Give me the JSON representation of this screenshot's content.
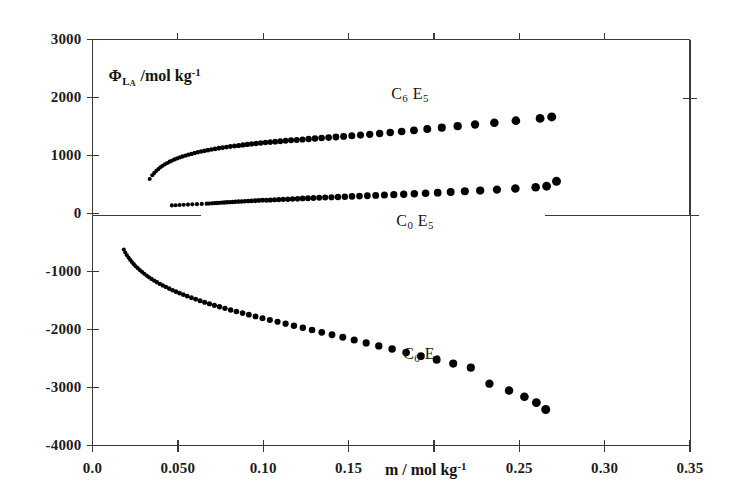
{
  "chart_data": {
    "type": "scatter",
    "title": "",
    "xlabel": "m / mol kg⁻¹",
    "ylabel": "ΦLₐ /mol kg⁻¹",
    "xlim": [
      0.0,
      0.35
    ],
    "ylim": [
      -4000,
      3000
    ],
    "grid": false,
    "legend": "inline-annotations",
    "marker": "filled-circle",
    "marker_color": "#000000",
    "xticks": [
      0.0,
      0.05,
      0.1,
      0.15,
      0.2,
      0.25,
      0.3,
      0.35
    ],
    "xtick_labels": [
      "0.0",
      "0.050",
      "0.10",
      "0.15",
      "",
      "0.25",
      "0.30",
      "0.35"
    ],
    "yticks": [
      3000,
      2000,
      1000,
      0,
      -1000,
      -2000,
      -3000,
      -4000
    ],
    "ytick_labels": [
      "3000",
      "2000",
      "1000",
      "0",
      "-1000",
      "-2000",
      "-3000",
      "-4000"
    ],
    "series": [
      {
        "name": "C6E5",
        "label_text": "C6 E5",
        "label_x": 0.175,
        "label_y": 2030,
        "points": [
          [
            0.0335,
            595
          ],
          [
            0.035,
            660
          ],
          [
            0.0362,
            700
          ],
          [
            0.0374,
            735
          ],
          [
            0.0386,
            768
          ],
          [
            0.0398,
            797
          ],
          [
            0.041,
            823
          ],
          [
            0.0424,
            848
          ],
          [
            0.0438,
            871
          ],
          [
            0.0452,
            893
          ],
          [
            0.0466,
            913
          ],
          [
            0.0481,
            932
          ],
          [
            0.0496,
            950
          ],
          [
            0.0512,
            967
          ],
          [
            0.0528,
            983
          ],
          [
            0.0545,
            999
          ],
          [
            0.0562,
            1014
          ],
          [
            0.058,
            1028
          ],
          [
            0.0598,
            1042
          ],
          [
            0.0617,
            1055
          ],
          [
            0.0636,
            1068
          ],
          [
            0.0656,
            1080
          ],
          [
            0.0676,
            1092
          ],
          [
            0.0697,
            1103
          ],
          [
            0.0718,
            1114
          ],
          [
            0.074,
            1125
          ],
          [
            0.0762,
            1135
          ],
          [
            0.0785,
            1145
          ],
          [
            0.0808,
            1155
          ],
          [
            0.0832,
            1164
          ],
          [
            0.0856,
            1173
          ],
          [
            0.0881,
            1182
          ],
          [
            0.0906,
            1190
          ],
          [
            0.0932,
            1199
          ],
          [
            0.0958,
            1207
          ],
          [
            0.0985,
            1215
          ],
          [
            0.1013,
            1223
          ],
          [
            0.1041,
            1231
          ],
          [
            0.107,
            1238
          ],
          [
            0.11,
            1246
          ],
          [
            0.1131,
            1253
          ],
          [
            0.1163,
            1261
          ],
          [
            0.1196,
            1268
          ],
          [
            0.123,
            1276
          ],
          [
            0.1266,
            1284
          ],
          [
            0.1303,
            1292
          ],
          [
            0.1342,
            1300
          ],
          [
            0.1383,
            1309
          ],
          [
            0.1426,
            1319
          ],
          [
            0.1471,
            1329
          ],
          [
            0.1519,
            1340
          ],
          [
            0.157,
            1352
          ],
          [
            0.1624,
            1365
          ],
          [
            0.1682,
            1380
          ],
          [
            0.1744,
            1396
          ],
          [
            0.1811,
            1414
          ],
          [
            0.1883,
            1434
          ],
          [
            0.1961,
            1456
          ],
          [
            0.2046,
            1480
          ],
          [
            0.2139,
            1506
          ],
          [
            0.2241,
            1534
          ],
          [
            0.2354,
            1565
          ],
          [
            0.248,
            1600
          ],
          [
            0.2622,
            1640
          ],
          [
            0.269,
            1665
          ]
        ]
      },
      {
        "name": "C0E5",
        "label_text": "C0 E5",
        "label_x": 0.178,
        "label_y": -160,
        "points": [
          [
            0.0465,
            140
          ],
          [
            0.0487,
            143
          ],
          [
            0.051,
            146
          ],
          [
            0.0534,
            150
          ],
          [
            0.0559,
            154
          ],
          [
            0.0585,
            158
          ],
          [
            0.0612,
            161
          ],
          [
            0.064,
            165
          ],
          [
            0.0669,
            169
          ],
          [
            0.0683,
            171
          ],
          [
            0.07,
            175
          ],
          [
            0.0714,
            178
          ],
          [
            0.0728,
            181
          ],
          [
            0.0742,
            184
          ],
          [
            0.0757,
            187
          ],
          [
            0.0772,
            190
          ],
          [
            0.0788,
            193
          ],
          [
            0.0804,
            196
          ],
          [
            0.0821,
            199
          ],
          [
            0.0838,
            202
          ],
          [
            0.0856,
            205
          ],
          [
            0.0874,
            208
          ],
          [
            0.0893,
            211
          ],
          [
            0.0912,
            214
          ],
          [
            0.0932,
            217
          ],
          [
            0.0953,
            220
          ],
          [
            0.0974,
            223
          ],
          [
            0.0996,
            227
          ],
          [
            0.1019,
            230
          ],
          [
            0.1042,
            233
          ],
          [
            0.1066,
            237
          ],
          [
            0.1091,
            240
          ],
          [
            0.1117,
            244
          ],
          [
            0.1144,
            247
          ],
          [
            0.1172,
            251
          ],
          [
            0.1201,
            255
          ],
          [
            0.1231,
            259
          ],
          [
            0.1262,
            263
          ],
          [
            0.1294,
            267
          ],
          [
            0.1328,
            271
          ],
          [
            0.1363,
            275
          ],
          [
            0.14,
            280
          ],
          [
            0.1438,
            285
          ],
          [
            0.1478,
            290
          ],
          [
            0.152,
            295
          ],
          [
            0.1564,
            300
          ],
          [
            0.161,
            306
          ],
          [
            0.1659,
            312
          ],
          [
            0.171,
            318
          ],
          [
            0.1765,
            325
          ],
          [
            0.1823,
            332
          ],
          [
            0.1885,
            340
          ],
          [
            0.1951,
            349
          ],
          [
            0.2022,
            359
          ],
          [
            0.2098,
            370
          ],
          [
            0.2181,
            382
          ],
          [
            0.2271,
            396
          ],
          [
            0.2369,
            412
          ],
          [
            0.2477,
            430
          ],
          [
            0.2596,
            452
          ],
          [
            0.266,
            470
          ],
          [
            0.2718,
            555
          ]
        ]
      },
      {
        "name": "C6E0",
        "label_text": "C6 E0",
        "label_x": 0.182,
        "label_y": -2450,
        "points": [
          [
            0.0183,
            -620
          ],
          [
            0.0192,
            -672
          ],
          [
            0.0201,
            -718
          ],
          [
            0.0211,
            -760
          ],
          [
            0.0221,
            -800
          ],
          [
            0.0231,
            -838
          ],
          [
            0.0242,
            -874
          ],
          [
            0.0253,
            -909
          ],
          [
            0.0265,
            -943
          ],
          [
            0.0277,
            -976
          ],
          [
            0.029,
            -1008
          ],
          [
            0.0303,
            -1039
          ],
          [
            0.0317,
            -1070
          ],
          [
            0.0331,
            -1100
          ],
          [
            0.0346,
            -1129
          ],
          [
            0.0362,
            -1158
          ],
          [
            0.0378,
            -1186
          ],
          [
            0.0395,
            -1214
          ],
          [
            0.0412,
            -1241
          ],
          [
            0.043,
            -1268
          ],
          [
            0.0449,
            -1295
          ],
          [
            0.0469,
            -1322
          ],
          [
            0.0489,
            -1348
          ],
          [
            0.051,
            -1374
          ],
          [
            0.0532,
            -1400
          ],
          [
            0.0555,
            -1426
          ],
          [
            0.0579,
            -1452
          ],
          [
            0.0604,
            -1478
          ],
          [
            0.063,
            -1504
          ],
          [
            0.0657,
            -1530
          ],
          [
            0.0685,
            -1556
          ],
          [
            0.0714,
            -1582
          ],
          [
            0.0744,
            -1608
          ],
          [
            0.0776,
            -1635
          ],
          [
            0.0809,
            -1662
          ],
          [
            0.0843,
            -1689
          ],
          [
            0.0879,
            -1717
          ],
          [
            0.0916,
            -1745
          ],
          [
            0.0955,
            -1774
          ],
          [
            0.0996,
            -1804
          ],
          [
            0.1039,
            -1835
          ],
          [
            0.1084,
            -1867
          ],
          [
            0.1131,
            -1900
          ],
          [
            0.118,
            -1935
          ],
          [
            0.1232,
            -1971
          ],
          [
            0.1286,
            -2009
          ],
          [
            0.1343,
            -2049
          ],
          [
            0.1403,
            -2091
          ],
          [
            0.1466,
            -2135
          ],
          [
            0.1533,
            -2182
          ],
          [
            0.1603,
            -2231
          ],
          [
            0.1677,
            -2283
          ],
          [
            0.1755,
            -2338
          ],
          [
            0.1837,
            -2396
          ],
          [
            0.1924,
            -2457
          ],
          [
            0.2016,
            -2521
          ],
          [
            0.2113,
            -2588
          ],
          [
            0.2216,
            -2659
          ],
          [
            0.2325,
            -2934
          ],
          [
            0.244,
            -3052
          ],
          [
            0.253,
            -3160
          ],
          [
            0.26,
            -3260
          ],
          [
            0.2655,
            -3380
          ]
        ]
      }
    ]
  },
  "axes": {
    "y_axis_title_main": "Φ",
    "y_axis_title_sub_l": "L",
    "y_axis_title_sub_a": "A",
    "y_axis_title_unit": "/mol kg",
    "y_axis_title_exp": "-1",
    "x_axis_title_main": "m / mol kg",
    "x_axis_title_exp": "-1",
    "frame_color": "#3a3a3a"
  },
  "series_labels": {
    "c6e5": {
      "c": "C",
      "c_sub": "6",
      "e": "E",
      "e_sub": "5"
    },
    "c0e5": {
      "c": "C",
      "c_sub": "0",
      "e": "E",
      "e_sub": "5"
    },
    "c6e0": {
      "c": "C",
      "c_sub": "6",
      "e": "E",
      "e_sub": "0"
    }
  }
}
